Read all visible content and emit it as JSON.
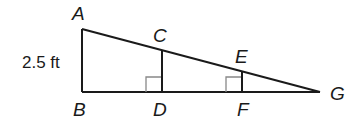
{
  "diagram": {
    "type": "similar right triangles",
    "points": {
      "A": {
        "label": "A",
        "x": 82,
        "y": 29
      },
      "B": {
        "label": "B",
        "x": 82,
        "y": 92
      },
      "C": {
        "label": "C",
        "x": 162,
        "y": 50
      },
      "D": {
        "label": "D",
        "x": 162,
        "y": 92
      },
      "E": {
        "label": "E",
        "x": 242,
        "y": 71
      },
      "F": {
        "label": "F",
        "x": 242,
        "y": 92
      },
      "G": {
        "label": "G",
        "x": 320,
        "y": 92
      }
    },
    "segments": [
      "AB",
      "BG",
      "AG",
      "CD",
      "EF"
    ],
    "right_angles": [
      "CDB",
      "EFD"
    ],
    "measurements": [
      {
        "segment": "AB",
        "text": "2.5 ft"
      }
    ],
    "colors": {
      "line": "#1a1a1a",
      "right_angle_mark": "#888888",
      "background": "#ffffff"
    }
  }
}
